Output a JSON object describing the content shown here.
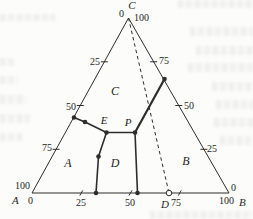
{
  "figure": {
    "type": "ternary-phase-diagram",
    "canvas": {
      "width": 253,
      "height": 219,
      "background": "#fcfcfa"
    },
    "style": {
      "line_color": "#2d2d2d",
      "text_color": "#1f1f1f",
      "thin_width": 1,
      "boundary_width": 1.6,
      "thick_width": 2.2,
      "dot_radius": 2.3,
      "open_dot_radius": 2.8
    },
    "triangle": {
      "apex": [
        128.5,
        18
      ],
      "bottom_left": [
        32,
        193
      ],
      "bottom_right": [
        229,
        193
      ]
    },
    "axes": {
      "left_edge_scale": [
        "0",
        "25",
        "50",
        "75",
        "100"
      ],
      "right_edge_scale": [
        "100",
        "75",
        "50",
        "25",
        "0"
      ],
      "bottom_edge_scale": [
        "0",
        "25",
        "50",
        "75",
        "100"
      ]
    },
    "ticks": [
      {
        "x1": 100.9,
        "y1": 61.8,
        "x2": 107.9,
        "y2": 61.8,
        "name": "left-tick-25"
      },
      {
        "x1": 76.8,
        "y1": 105.5,
        "x2": 83.8,
        "y2": 105.5,
        "name": "left-tick-50"
      },
      {
        "x1": 52.6,
        "y1": 149.3,
        "x2": 59.6,
        "y2": 149.3,
        "name": "left-tick-75"
      },
      {
        "x1": 150.1,
        "y1": 61.8,
        "x2": 157.1,
        "y2": 61.8,
        "name": "right-tick-75"
      },
      {
        "x1": 175.3,
        "y1": 105.5,
        "x2": 182.3,
        "y2": 105.5,
        "name": "right-tick-50"
      },
      {
        "x1": 200.4,
        "y1": 149.3,
        "x2": 207.4,
        "y2": 149.3,
        "name": "right-tick-25"
      },
      {
        "x1": 79.8,
        "y1": 195.6,
        "x2": 82.7,
        "y2": 190.4,
        "name": "bottom-tick-25"
      },
      {
        "x1": 129.0,
        "y1": 195.6,
        "x2": 132.0,
        "y2": 190.4,
        "name": "bottom-tick-50"
      },
      {
        "x1": 178.3,
        "y1": 195.6,
        "x2": 181.2,
        "y2": 190.4,
        "name": "bottom-tick-75"
      }
    ],
    "phase_boundaries": [
      {
        "name": "boundary-leftedge-to-E",
        "points": [
          [
            74,
            117.5
          ],
          [
            85,
            122
          ],
          [
            106.5,
            132.5
          ]
        ],
        "width": 1.6
      },
      {
        "name": "boundary-E-to-P",
        "points": [
          [
            106.5,
            132.5
          ],
          [
            135,
            132.5
          ]
        ],
        "width": 1.6
      },
      {
        "name": "boundary-P-to-rightedge",
        "points": [
          [
            135,
            132.5
          ],
          [
            164.5,
            79
          ]
        ],
        "width": 2.2
      },
      {
        "name": "boundary-E-to-bottom",
        "points": [
          [
            106.5,
            132.5
          ],
          [
            98.5,
            156.5
          ],
          [
            96,
            193
          ]
        ],
        "width": 1.6
      },
      {
        "name": "boundary-P-to-bottom",
        "points": [
          [
            135,
            132.5
          ],
          [
            137.5,
            193
          ]
        ],
        "width": 1.6
      }
    ],
    "dashed_line": {
      "name": "dashed-line-C-to-D",
      "points": [
        [
          128.5,
          18
        ],
        [
          169,
          193
        ]
      ],
      "dash": "3.5 3",
      "width": 1
    },
    "filled_points": [
      {
        "x": 74,
        "y": 117.5,
        "name": "point-on-left-edge"
      },
      {
        "x": 85,
        "y": 122,
        "name": "point-mid-left-boundary"
      },
      {
        "x": 106.5,
        "y": 132.5,
        "name": "point-E"
      },
      {
        "x": 135,
        "y": 132.5,
        "name": "point-P"
      },
      {
        "x": 164.5,
        "y": 79,
        "name": "point-on-right-edge"
      },
      {
        "x": 98.5,
        "y": 156.5,
        "name": "point-mid-E-bottom"
      },
      {
        "x": 96,
        "y": 193,
        "name": "point-bottom-left"
      },
      {
        "x": 137.5,
        "y": 193,
        "name": "point-bottom-right"
      }
    ],
    "open_points": [
      {
        "x": 169,
        "y": 193,
        "name": "point-D-open"
      }
    ],
    "labels": [
      {
        "text": "C",
        "x": 132,
        "y": 9,
        "anchor": "middle",
        "italic": true,
        "size": 11,
        "name": "vertex-c-label"
      },
      {
        "text": "0",
        "x": 124,
        "y": 17,
        "anchor": "end",
        "italic": false,
        "size": 10,
        "name": "left-scale-0"
      },
      {
        "text": "100",
        "x": 134,
        "y": 21,
        "anchor": "start",
        "italic": false,
        "size": 10,
        "name": "right-scale-100"
      },
      {
        "text": "25",
        "x": 100,
        "y": 65,
        "anchor": "end",
        "italic": false,
        "size": 10,
        "name": "left-scale-25"
      },
      {
        "text": "50",
        "x": 76,
        "y": 110,
        "anchor": "end",
        "italic": false,
        "size": 10,
        "name": "left-scale-50"
      },
      {
        "text": "75",
        "x": 52,
        "y": 151,
        "anchor": "end",
        "italic": false,
        "size": 10,
        "name": "left-scale-75"
      },
      {
        "text": "75",
        "x": 159,
        "y": 64,
        "anchor": "start",
        "italic": false,
        "size": 10,
        "name": "right-scale-75"
      },
      {
        "text": "50",
        "x": 184,
        "y": 109,
        "anchor": "start",
        "italic": false,
        "size": 10,
        "name": "right-scale-50"
      },
      {
        "text": "25",
        "x": 207,
        "y": 152,
        "anchor": "start",
        "italic": false,
        "size": 10,
        "name": "right-scale-25"
      },
      {
        "text": "100",
        "x": 30,
        "y": 189,
        "anchor": "end",
        "italic": false,
        "size": 10,
        "name": "left-scale-100"
      },
      {
        "text": "A",
        "x": 12,
        "y": 204,
        "anchor": "start",
        "italic": true,
        "size": 11,
        "name": "vertex-a-label"
      },
      {
        "text": "0",
        "x": 28,
        "y": 204,
        "anchor": "start",
        "italic": false,
        "size": 10,
        "name": "bottom-scale-0"
      },
      {
        "text": "25",
        "x": 81,
        "y": 206,
        "anchor": "middle",
        "italic": false,
        "size": 10,
        "name": "bottom-scale-25"
      },
      {
        "text": "50",
        "x": 130,
        "y": 206,
        "anchor": "middle",
        "italic": false,
        "size": 10,
        "name": "bottom-scale-50"
      },
      {
        "text": "D",
        "x": 161,
        "y": 208,
        "anchor": "start",
        "italic": true,
        "size": 11,
        "name": "point-d-label"
      },
      {
        "text": "75",
        "x": 171,
        "y": 206,
        "anchor": "start",
        "italic": false,
        "size": 10,
        "name": "bottom-scale-75"
      },
      {
        "text": "0",
        "x": 231,
        "y": 191,
        "anchor": "start",
        "italic": false,
        "size": 10,
        "name": "right-scale-0"
      },
      {
        "text": "100",
        "x": 234,
        "y": 204,
        "anchor": "end",
        "italic": false,
        "size": 10,
        "name": "bottom-scale-100"
      },
      {
        "text": "B",
        "x": 239,
        "y": 206,
        "anchor": "start",
        "italic": true,
        "size": 11,
        "name": "vertex-b-label"
      },
      {
        "text": "C",
        "x": 115,
        "y": 95,
        "anchor": "middle",
        "italic": true,
        "size": 12,
        "name": "region-c-label"
      },
      {
        "text": "A",
        "x": 68,
        "y": 167,
        "anchor": "middle",
        "italic": true,
        "size": 12,
        "name": "region-a-label"
      },
      {
        "text": "D",
        "x": 115,
        "y": 167,
        "anchor": "middle",
        "italic": true,
        "size": 12,
        "name": "region-d-label"
      },
      {
        "text": "B",
        "x": 186,
        "y": 165,
        "anchor": "middle",
        "italic": true,
        "size": 12,
        "name": "region-b-label"
      },
      {
        "text": "E",
        "x": 104,
        "y": 124,
        "anchor": "middle",
        "italic": true,
        "size": 11,
        "name": "point-e-label"
      },
      {
        "text": "P",
        "x": 128,
        "y": 126,
        "anchor": "middle",
        "italic": true,
        "size": 11,
        "name": "point-p-label"
      }
    ]
  }
}
